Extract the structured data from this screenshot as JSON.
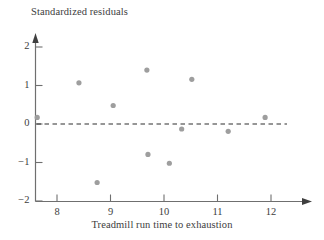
{
  "chart_data": {
    "type": "scatter",
    "title": "",
    "xlabel": "Treadmill run time to exhaustion",
    "ylabel": "Standardized residuals",
    "xlim": [
      7.35,
      12.5
    ],
    "ylim": [
      -2.15,
      2.35
    ],
    "xticks": [
      8,
      9,
      10,
      11,
      12
    ],
    "yticks": [
      2,
      1,
      0,
      -1,
      -2
    ],
    "xtick_labels": [
      "8",
      "9",
      "10",
      "11",
      "12"
    ],
    "ytick_labels": [
      "2",
      "1",
      "0",
      "−1",
      "−2"
    ],
    "grid": false,
    "legend": null,
    "reference_lines": [
      {
        "name": "zero-residual-line",
        "orientation": "horizontal",
        "value": 0,
        "style": "dashed"
      }
    ],
    "points": [
      {
        "x": 7.63,
        "y": 0.17
      },
      {
        "x": 8.41,
        "y": 1.07
      },
      {
        "x": 8.75,
        "y": -1.52
      },
      {
        "x": 9.05,
        "y": 0.48
      },
      {
        "x": 9.68,
        "y": 1.4
      },
      {
        "x": 9.7,
        "y": -0.79
      },
      {
        "x": 10.1,
        "y": -1.02
      },
      {
        "x": 10.33,
        "y": -0.13
      },
      {
        "x": 10.52,
        "y": 1.16
      },
      {
        "x": 11.2,
        "y": -0.19
      },
      {
        "x": 11.89,
        "y": 0.17
      }
    ],
    "marker": {
      "shape": "circle",
      "radius": 2.6,
      "color": "#9e9e9e"
    },
    "axis_color": "#6f6f6f",
    "text_color": "#3d3d3d"
  }
}
